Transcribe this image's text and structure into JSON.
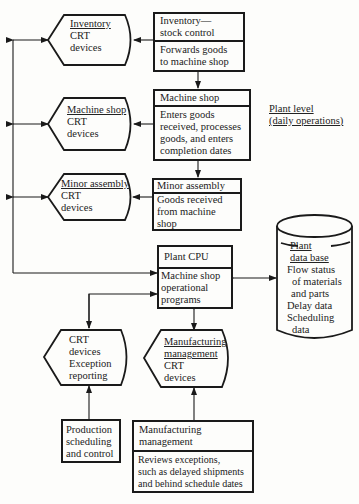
{
  "diagram": {
    "crt_terminals": [
      {
        "id": "inventory-crt",
        "title": "Inventory",
        "lines": [
          "CRT",
          "devices"
        ]
      },
      {
        "id": "machine-shop-crt",
        "title": "Machine shop",
        "lines": [
          "CRT",
          "devices"
        ]
      },
      {
        "id": "minor-assembly-crt",
        "title": "Minor assembly",
        "lines": [
          "CRT",
          "devices"
        ]
      },
      {
        "id": "exception-crt",
        "lines": [
          "CRT",
          "devices",
          "Exception",
          "reporting"
        ]
      },
      {
        "id": "mfg-mgmt-crt",
        "title_lines": [
          "Manufacturing",
          "management"
        ],
        "lines": [
          "CRT",
          "devices"
        ]
      }
    ],
    "process_boxes": [
      {
        "id": "inventory",
        "title_lines": [
          "Inventory—",
          "stock control"
        ],
        "body_lines": [
          "Forwards goods",
          "to machine shop"
        ]
      },
      {
        "id": "machine-shop",
        "title_lines": [
          "Machine shop"
        ],
        "body_lines": [
          "Enters goods",
          "received, processes",
          "goods, and enters",
          "completion dates"
        ]
      },
      {
        "id": "minor-assembly",
        "title_lines": [
          "Minor assembly"
        ],
        "body_lines": [
          "Goods received",
          "from machine",
          "shop"
        ]
      },
      {
        "id": "plant-cpu",
        "title_lines": [
          "Plant CPU"
        ],
        "body_lines": [
          "Machine shop",
          "operational",
          "programs"
        ]
      },
      {
        "id": "production",
        "body_lines": [
          "Production",
          "scheduling",
          "and control"
        ]
      },
      {
        "id": "mfg-mgmt",
        "title_lines": [
          "Manufacturing",
          "management"
        ],
        "body_lines": [
          "Reviews exceptions,",
          "such as delayed shipments",
          "and behind schedule dates"
        ]
      }
    ],
    "database": {
      "title_lines": [
        "Plant",
        "data base"
      ],
      "lines": [
        "Flow status",
        "of materials",
        "and parts",
        "Delay data",
        "Scheduling",
        "data"
      ]
    },
    "label": {
      "lines": [
        "Plant level",
        "(daily operations)"
      ]
    }
  }
}
